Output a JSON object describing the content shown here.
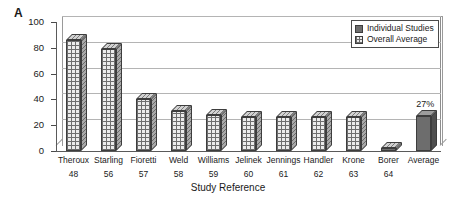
{
  "panel": {
    "letter": "A"
  },
  "legend": {
    "items": [
      {
        "label": "Individual Studies",
        "swatch": "solid-gray-swatch",
        "color": "#6d6d6d"
      },
      {
        "label": "Overall Average",
        "swatch": "hatched-swatch",
        "color": "#ececec"
      }
    ]
  },
  "chart_data": {
    "type": "bar",
    "title": "",
    "xlabel": "Study Reference",
    "ylabel": "Sensitivity for CD/MI (%)",
    "ylim": [
      0,
      100
    ],
    "yticks": [
      0,
      20,
      40,
      60,
      80,
      100
    ],
    "grid": true,
    "legend_position": "top-right",
    "categories": [
      "Theroux",
      "Starling",
      "Fioretti",
      "Weld",
      "Williams",
      "Jelinek",
      "Jennings",
      "Handler",
      "Krone",
      "Borer",
      "Average"
    ],
    "reference_numbers": [
      "48",
      "56",
      "57",
      "58",
      "59",
      "60",
      "61",
      "62",
      "63",
      "64",
      ""
    ],
    "values": [
      86,
      79,
      40,
      31,
      28,
      26,
      26,
      26,
      26,
      2,
      27
    ],
    "series_of_point": [
      "Overall Average",
      "Overall Average",
      "Overall Average",
      "Overall Average",
      "Overall Average",
      "Overall Average",
      "Overall Average",
      "Overall Average",
      "Overall Average",
      "Overall Average",
      "Individual Studies"
    ],
    "data_labels": [
      "",
      "",
      "",
      "",
      "",
      "",
      "",
      "",
      "",
      "",
      "27%"
    ]
  }
}
